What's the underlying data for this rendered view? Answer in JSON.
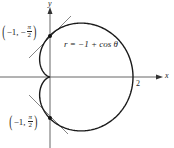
{
  "figure": {
    "equation": "r = −1 + cos θ",
    "axes": {
      "x_label": "x",
      "y_label": "y",
      "x_tick": "2"
    },
    "points": [
      {
        "r": "−1,",
        "sign": "−",
        "num": "π",
        "den": "2",
        "position": "top"
      },
      {
        "r": "−1,",
        "sign": "",
        "num": "π",
        "den": "2",
        "position": "bottom"
      }
    ],
    "colors": {
      "curve": "#1a1a1a",
      "axis": "#555555",
      "tangent": "#666666"
    }
  },
  "chart_data": {
    "type": "line",
    "title": "",
    "curve": "r = -1 + cos θ (cardioid)",
    "xlabel": "x",
    "ylabel": "y",
    "x_ticks": [
      "2"
    ],
    "marked_points": [
      {
        "polar": "(-1, -π/2)",
        "cartesian": [
          0,
          1
        ],
        "tangent_slope": 1
      },
      {
        "polar": "(-1, π/2)",
        "cartesian": [
          0,
          -1
        ],
        "tangent_slope": -1
      }
    ],
    "cusp": [
      0,
      0
    ],
    "xlim": [
      -1.2,
      2.3
    ],
    "ylim": [
      -1.7,
      1.8
    ],
    "grid": false
  }
}
